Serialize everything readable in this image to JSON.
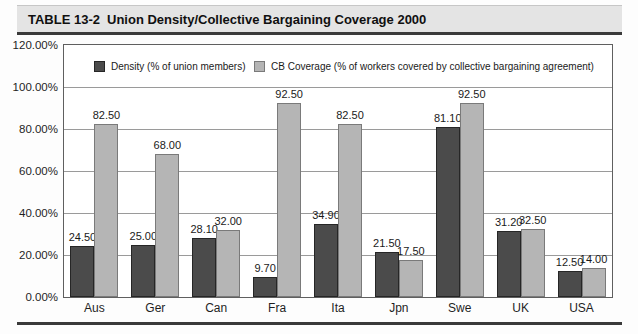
{
  "title": {
    "label": "TABLE 13-2",
    "text": "Union Density/Collective Bargaining Coverage 2000"
  },
  "chart_data": {
    "type": "bar",
    "title": "Union Density/Collective Bargaining Coverage 2000",
    "categories": [
      "Aus",
      "Ger",
      "Can",
      "Fra",
      "Ita",
      "Jpn",
      "Swe",
      "UK",
      "USA"
    ],
    "series": [
      {
        "name": "Density (% of union members)",
        "color": "#4b4b4b",
        "border_color": "#262626",
        "values": [
          24.5,
          25.0,
          28.1,
          9.7,
          34.9,
          21.5,
          81.1,
          31.2,
          12.5
        ]
      },
      {
        "name": "CB Coverage (% of workers covered by collective bargaining agreement)",
        "color": "#b5b5b5",
        "border_color": "#7a7a7a",
        "values": [
          82.5,
          68.0,
          32.0,
          92.5,
          82.5,
          17.5,
          92.5,
          32.5,
          14.0
        ]
      }
    ],
    "value_label_decimals": 2,
    "y_ticks": [
      "120.00%",
      "100.00%",
      "80.00%",
      "60.00%",
      "40.00%",
      "20.00%",
      "0.00%"
    ],
    "ylim": [
      0,
      120
    ],
    "grid": true,
    "legend_position": "top-inside",
    "xlabel": "",
    "ylabel": ""
  }
}
